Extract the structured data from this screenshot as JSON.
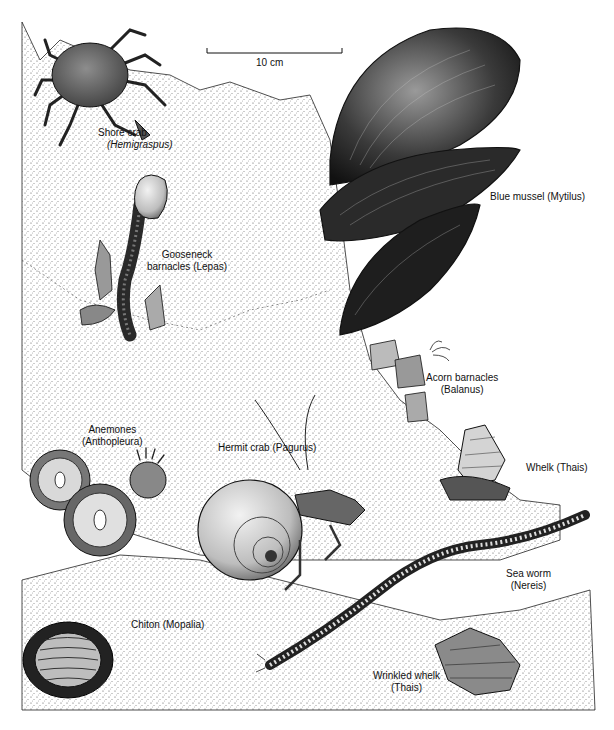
{
  "figure": {
    "type": "naturalist illustration",
    "colors": {
      "ink": "#111111",
      "paper": "#ffffff",
      "stipple": "#555555",
      "shell_dark": "#1c1c1c",
      "shell_mid": "#6b6b6b"
    }
  },
  "scale_bar": {
    "label": "10 cm"
  },
  "organisms": [
    {
      "id": "shore-crab",
      "common": "Shore crab",
      "genus": "Hemigraspus",
      "line1": "Shore crab",
      "line2": "(Hemigraspus)"
    },
    {
      "id": "gooseneck-barnacles",
      "common": "Gooseneck barnacles",
      "genus": "Lepas",
      "line1": "Gooseneck",
      "line2": "barnacles (Lepas)"
    },
    {
      "id": "blue-mussel",
      "common": "Blue mussel",
      "genus": "Mytilus",
      "line1": "Blue mussel (Mytilus)"
    },
    {
      "id": "acorn-barnacles",
      "common": "Acorn barnacles",
      "genus": "Balanus",
      "line1": "Acorn barnacles",
      "line2": "(Balanus)"
    },
    {
      "id": "anemones",
      "common": "Anemones",
      "genus": "Anthopleura",
      "line1": "Anemones",
      "line2": "(Anthopleura)"
    },
    {
      "id": "hermit-crab",
      "common": "Hermit crab",
      "genus": "Pagurus",
      "line1": "Hermit crab (Pagurus)"
    },
    {
      "id": "whelk",
      "common": "Whelk",
      "genus": "Thais",
      "line1": "Whelk (Thais)"
    },
    {
      "id": "sea-worm",
      "common": "Sea worm",
      "genus": "Nereis",
      "line1": "Sea worm",
      "line2": "(Nereis)"
    },
    {
      "id": "chiton",
      "common": "Chiton",
      "genus": "Mopalia",
      "line1": "Chiton (Mopalia)"
    },
    {
      "id": "wrinkled-whelk",
      "common": "Wrinkled whelk",
      "genus": "Thais",
      "line1": "Wrinkled whelk",
      "line2": "(Thais)"
    }
  ]
}
